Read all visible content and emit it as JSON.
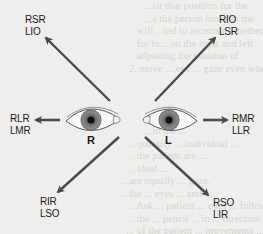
{
  "diagram": {
    "eyes": [
      {
        "id": "right",
        "label": "R"
      },
      {
        "id": "left",
        "label": "L"
      }
    ],
    "directions": {
      "up_right_of_patient_left_side": {
        "line1": "RSR",
        "line2": "LIO"
      },
      "up_left_side": {
        "line1": "RIO",
        "line2": "LSR"
      },
      "left_side_horizontal": {
        "line1": "RLR",
        "line2": "LMR"
      },
      "right_side_horizontal": {
        "line1": "RMR",
        "line2": "LLR"
      },
      "down_left_side": {
        "line1": "RIR",
        "line2": "LSO"
      },
      "down_right_side": {
        "line1": "RSO",
        "line2": "LIR"
      }
    },
    "colors": {
      "arrow": "#4a4a4a",
      "iris_outer": "#8a8a8a",
      "iris_inner": "#5a5a5a",
      "pupil": "#111111",
      "background": "#efeeec"
    }
  },
  "background_text": "                 ...ist that position for the\n                 ...s the person looks in the\n              will ...ted to ascertain whether\n              for lo... on the right and left\n              adjusting the position of\n           2. move ... eye ... gaze even when\n\n\n\n\n                 ...in the ...\n          ... quantify ... individual ...\n          ... the patient are ...\n          ... ideal ...\n       ... are equally ... gaze.\n       ... the ... eyes ... and ...\n          ... Ask ... patient ... eyes ... follow\n          ... the ... pencil ... in ... direction\n          ... of the patient ... movements ...\n          ... the ... right ... and ... left ...\n          ... normally ... fields ..."
}
